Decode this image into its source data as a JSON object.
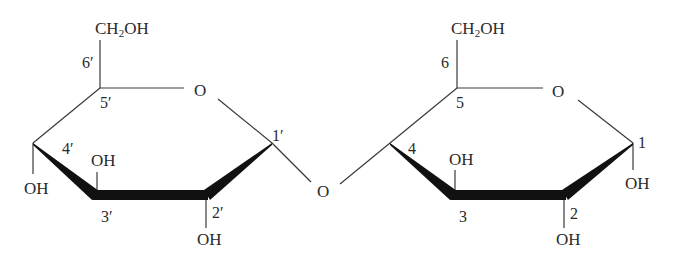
{
  "diagram": {
    "type": "chemical-structure",
    "colors": {
      "line": "#3a3a3a",
      "wedge": "#111111",
      "text": "#2a2a2a",
      "background": "#ffffff"
    },
    "left_ring": {
      "ch2oh": {
        "main": "CH",
        "sub": "2",
        "tail": "OH"
      },
      "ring_oxygen": "O",
      "carbon_labels": {
        "c1": "1′",
        "c2": "2′",
        "c3": "3′",
        "c4": "4′",
        "c5": "5′",
        "c6": "6′"
      },
      "substituents": {
        "c2_oh": "OH",
        "c3_oh": "OH",
        "c4_oh": "OH"
      }
    },
    "bridge": {
      "oxygen": "O"
    },
    "right_ring": {
      "ch2oh": {
        "main": "CH",
        "sub": "2",
        "tail": "OH"
      },
      "ring_oxygen": "O",
      "carbon_labels": {
        "c1": "1",
        "c2": "2",
        "c3": "3",
        "c4": "4",
        "c5": "5",
        "c6": "6"
      },
      "substituents": {
        "c1_oh": "OH",
        "c2_oh": "OH",
        "c3_oh": "OH"
      }
    }
  }
}
